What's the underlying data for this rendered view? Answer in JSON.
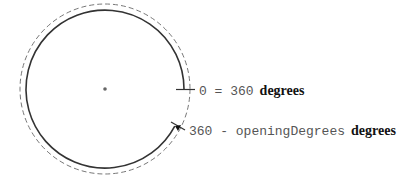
{
  "diagram": {
    "labels": {
      "start": {
        "code": "0 = 360",
        "unit": "degrees"
      },
      "end": {
        "code": "360 - openingDegrees",
        "unit": "degrees"
      }
    },
    "colors": {
      "solid_arc": "#333333",
      "dashed_arc": "#777777",
      "code_text": "#555555",
      "unit_text": "#111111",
      "center_dot": "#666666"
    },
    "geometry": {
      "center": [
        105,
        89
      ],
      "solid_radius": 79,
      "dashed_radius": 85,
      "gap_angle_degrees": 28
    }
  }
}
